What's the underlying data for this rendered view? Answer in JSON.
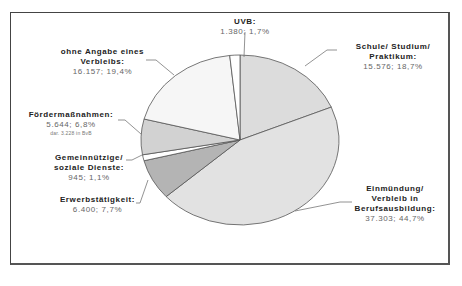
{
  "chart_data": {
    "type": "pie",
    "title": "",
    "start_angle_deg": 90,
    "direction": "clockwise",
    "slices": [
      {
        "label": "Schule/ Studium/ Praktikum",
        "value": 15576,
        "value_text": "15.576; 18,7%",
        "percent": 18.7,
        "color": "#dcdcdc"
      },
      {
        "label": "Einmündung/ Verbleib in Berufsausbildung",
        "value": 37303,
        "value_text": "37.303; 44,7%",
        "percent": 44.7,
        "color": "#e2e2e2"
      },
      {
        "label": "Erwerbstätigkeit",
        "value": 6400,
        "value_text": "6.400; 7,7%",
        "percent": 7.7,
        "color": "#b4b4b4"
      },
      {
        "label": "Gemeinnützige/ soziale Dienste",
        "value": 945,
        "value_text": "945; 1,1%",
        "percent": 1.1,
        "color": "#ffffff"
      },
      {
        "label": "Fördermaßnahmen",
        "value": 5644,
        "value_text": "5.644; 6,8%",
        "percent": 6.8,
        "color": "#d2d2d2",
        "note": "dar. 3.228 in BvB"
      },
      {
        "label": "ohne Angabe eines Verbleibs",
        "value": 16157,
        "value_text": "16.157; 19,4%",
        "percent": 19.4,
        "color": "#f6f6f6"
      },
      {
        "label": "UVB",
        "value": 1380,
        "value_text": "1.380; 1,7%",
        "percent": 1.7,
        "color": "#ffffff"
      }
    ],
    "legend": "none (data labels with leader lines)"
  },
  "labels": {
    "uvb": {
      "name": "UVB:",
      "val": "1.380; 1,7%"
    },
    "schule": {
      "name1": "Schule/ Studium/",
      "name2": "Praktikum:",
      "val": "15.576; 18,7%"
    },
    "ohne": {
      "name1": "ohne Angabe eines",
      "name2": "Verbleibs:",
      "val": "16.157; 19,4%"
    },
    "foerder": {
      "name": "Fördermaßnahmen:",
      "val": "5.644; 6,8%",
      "note": "dar. 3.228 in BvB"
    },
    "gemein": {
      "name1": "Gemeinnützige/",
      "name2": "soziale Dienste:",
      "val": "945; 1,1%"
    },
    "erwerb": {
      "name": "Erwerbstätigkeit:",
      "val": "6.400; 7,7%"
    },
    "einm": {
      "name1": "Einmündung/",
      "name2": "Verbleib in",
      "name3": "Berufsausbildung:",
      "val": "37.303; 44,7%"
    }
  }
}
